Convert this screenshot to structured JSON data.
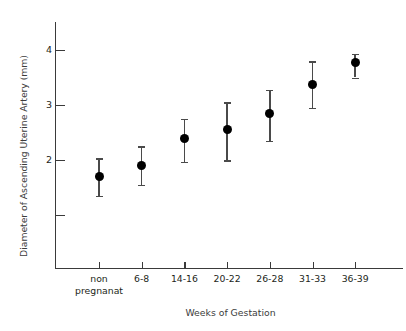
{
  "chart_data": {
    "type": "scatter",
    "title": "",
    "xlabel": "Weeks of Gestation",
    "ylabel": "Diameter of Ascending Uterine Artery (mm)",
    "categories": [
      "non\npregnanat",
      "6-8",
      "14-16",
      "20-22",
      "26-28",
      "31-33",
      "36-39"
    ],
    "values": [
      1.7,
      1.9,
      2.4,
      2.55,
      2.85,
      3.38,
      3.78
    ],
    "error_low": [
      1.35,
      1.55,
      1.97,
      2.0,
      2.35,
      2.95,
      3.5
    ],
    "error_high": [
      2.03,
      2.25,
      2.75,
      3.05,
      3.28,
      3.8,
      3.93
    ],
    "ylim": [
      0.5,
      4.45
    ],
    "ytick_values": [
      1,
      2,
      3,
      4
    ],
    "ytick_labels": [
      "",
      "2",
      "3",
      "4"
    ],
    "grid": false,
    "legend": "none",
    "marker_color": "#000000",
    "errorbar_color": "#4a4a4a",
    "axis_color": "#3a3a3a"
  }
}
